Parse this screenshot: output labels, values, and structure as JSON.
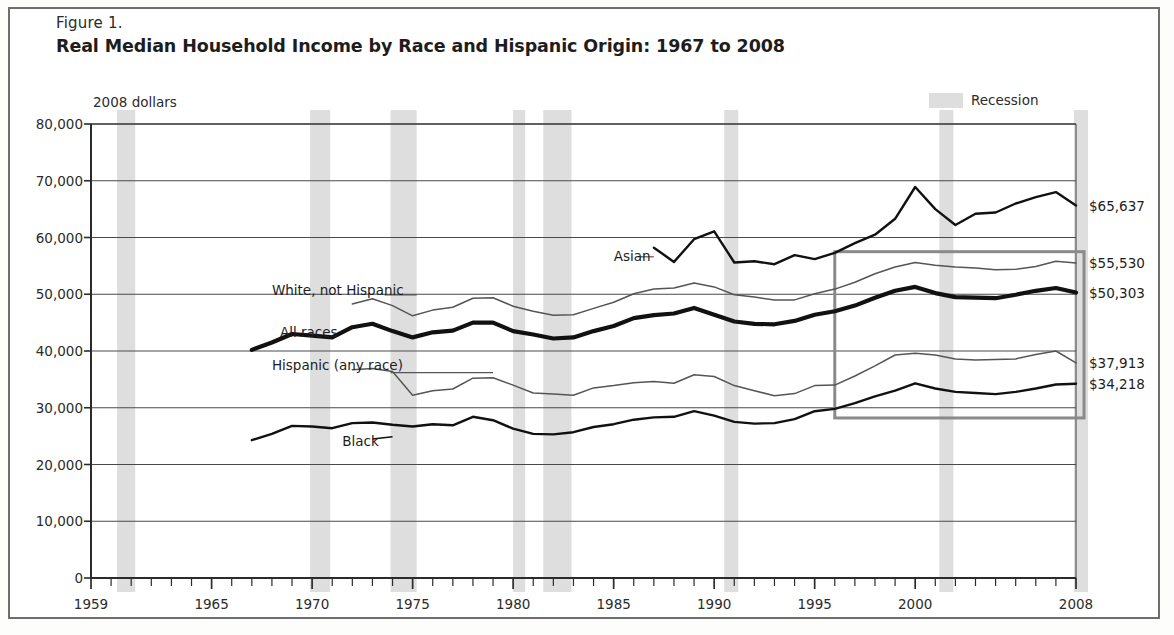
{
  "figure": {
    "label": "Figure 1.",
    "title": "Real Median Household Income by Race and Hispanic Origin: 1967 to 2008",
    "units_note": "2008 dollars"
  },
  "legend": {
    "recession_label": "Recession",
    "recession_color": "#dedede"
  },
  "colors": {
    "axis": "#2b2b2b",
    "grid": "#4a4a4a",
    "bold_line": "#111111",
    "thin_line": "#555555",
    "recession_band": "#dedede",
    "highlight_box_border": "#8a8a8a",
    "frame": "#6e6e6e"
  },
  "chart_data": {
    "type": "line",
    "title": "Real Median Household Income by Race and Hispanic Origin: 1967 to 2008",
    "subtitle": "2008 dollars",
    "xlabel": "",
    "ylabel": "2008 dollars",
    "xlim": [
      1959,
      2008
    ],
    "ylim": [
      0,
      80000
    ],
    "ytick_values": [
      0,
      10000,
      20000,
      30000,
      40000,
      50000,
      60000,
      70000,
      80000
    ],
    "ytick_labels": [
      "0",
      "10,000",
      "20,000",
      "30,000",
      "40,000",
      "50,000",
      "60,000",
      "70,000",
      "80,000"
    ],
    "xtick_values": [
      1959,
      1965,
      1970,
      1975,
      1980,
      1985,
      1990,
      1995,
      2000,
      2008
    ],
    "xtick_labels": [
      "1959",
      "1965",
      "1970",
      "1975",
      "1980",
      "1985",
      "1990",
      "1995",
      "2000",
      "2008"
    ],
    "xtick_minor_step": 1,
    "grid": "horizontal",
    "legend_position": "top-right",
    "recessions": [
      {
        "start": 1960.3,
        "end": 1961.2
      },
      {
        "start": 1969.9,
        "end": 1970.9
      },
      {
        "start": 1973.9,
        "end": 1975.2
      },
      {
        "start": 1980.0,
        "end": 1980.6
      },
      {
        "start": 1981.5,
        "end": 1982.9
      },
      {
        "start": 1990.5,
        "end": 1991.2
      },
      {
        "start": 2001.2,
        "end": 2001.9
      },
      {
        "start": 2007.9,
        "end": 2008.6
      }
    ],
    "highlight_box": {
      "x_start": 1996,
      "x_end": 2008.4,
      "y_bottom": 28200,
      "y_top": 57500
    },
    "annotations": [
      {
        "text": "Asian",
        "x": 1985.0,
        "y": 56600,
        "anchor": "right-of-start"
      },
      {
        "text": "White, not Hispanic",
        "x": 1968.0,
        "y": 50600
      },
      {
        "text": "All races",
        "x": 1968.4,
        "y": 43100
      },
      {
        "text": "Hispanic (any race)",
        "x": 1968.0,
        "y": 37300
      },
      {
        "text": "Black",
        "x": 1971.5,
        "y": 23900
      }
    ],
    "end_labels": [
      {
        "text": "$65,637",
        "series": "Asian",
        "value": 65637
      },
      {
        "text": "$55,530",
        "series": "White, not Hispanic",
        "value": 55530
      },
      {
        "text": "$50,303",
        "series": "All races",
        "value": 50303
      },
      {
        "text": "$37,913",
        "series": "Hispanic (any race)",
        "value": 37913
      },
      {
        "text": "$34,218",
        "series": "Black",
        "value": 34218
      }
    ],
    "series": [
      {
        "name": "Asian",
        "style": "medium",
        "x": [
          1987,
          1988,
          1989,
          1990,
          1991,
          1992,
          1993,
          1994,
          1995,
          1996,
          1997,
          1998,
          1999,
          2000,
          2001,
          2002,
          2003,
          2004,
          2005,
          2006,
          2007,
          2008
        ],
        "values": [
          58200,
          55700,
          59700,
          61100,
          55600,
          55800,
          55300,
          56900,
          56200,
          57300,
          59000,
          60500,
          63300,
          68900,
          65000,
          62200,
          64200,
          64400,
          66000,
          67100,
          68000,
          65637
        ]
      },
      {
        "name": "White, not Hispanic",
        "style": "thin",
        "x": [
          1972,
          1973,
          1974,
          1975,
          1976,
          1977,
          1978,
          1979,
          1980,
          1981,
          1982,
          1983,
          1984,
          1985,
          1986,
          1987,
          1988,
          1989,
          1990,
          1991,
          1992,
          1993,
          1994,
          1995,
          1996,
          1997,
          1998,
          1999,
          2000,
          2001,
          2002,
          2003,
          2004,
          2005,
          2006,
          2007,
          2008
        ],
        "values": [
          48300,
          49200,
          48000,
          46200,
          47200,
          47700,
          49300,
          49400,
          47900,
          47000,
          46300,
          46400,
          47500,
          48600,
          50100,
          50900,
          51100,
          52000,
          51300,
          49900,
          49500,
          49000,
          49000,
          50100,
          50900,
          52100,
          53600,
          54800,
          55600,
          55100,
          54800,
          54600,
          54300,
          54400,
          54900,
          55800,
          55530
        ]
      },
      {
        "name": "All races",
        "style": "bold",
        "x": [
          1967,
          1968,
          1969,
          1970,
          1971,
          1972,
          1973,
          1974,
          1975,
          1976,
          1977,
          1978,
          1979,
          1980,
          1981,
          1982,
          1983,
          1984,
          1985,
          1986,
          1987,
          1988,
          1989,
          1990,
          1991,
          1992,
          1993,
          1994,
          1995,
          1996,
          1997,
          1998,
          1999,
          2000,
          2001,
          2002,
          2003,
          2004,
          2005,
          2006,
          2007,
          2008
        ],
        "values": [
          40200,
          41500,
          43000,
          42700,
          42400,
          44200,
          44800,
          43500,
          42400,
          43300,
          43600,
          45000,
          45000,
          43500,
          42900,
          42200,
          42400,
          43500,
          44400,
          45800,
          46300,
          46600,
          47600,
          46400,
          45200,
          44800,
          44700,
          45300,
          46400,
          47000,
          48000,
          49400,
          50600,
          51300,
          50200,
          49500,
          49400,
          49300,
          49900,
          50600,
          51100,
          50303
        ]
      },
      {
        "name": "Hispanic (any race)",
        "style": "thin",
        "x": [
          1972,
          1973,
          1974,
          1975,
          1976,
          1977,
          1978,
          1979,
          1980,
          1981,
          1982,
          1983,
          1984,
          1985,
          1986,
          1987,
          1988,
          1989,
          1990,
          1991,
          1992,
          1993,
          1994,
          1995,
          1996,
          1997,
          1998,
          1999,
          2000,
          2001,
          2002,
          2003,
          2004,
          2005,
          2006,
          2007,
          2008
        ],
        "values": [
          36700,
          36900,
          36400,
          32200,
          33000,
          33300,
          35200,
          35300,
          34000,
          32600,
          32400,
          32200,
          33500,
          33900,
          34400,
          34600,
          34300,
          35800,
          35500,
          33900,
          33000,
          32100,
          32500,
          33900,
          34000,
          35600,
          37400,
          39300,
          39600,
          39300,
          38600,
          38400,
          38500,
          38600,
          39400,
          40000,
          37913
        ]
      },
      {
        "name": "Black",
        "style": "medium",
        "x": [
          1967,
          1968,
          1969,
          1970,
          1971,
          1972,
          1973,
          1974,
          1975,
          1976,
          1977,
          1978,
          1979,
          1980,
          1981,
          1982,
          1983,
          1984,
          1985,
          1986,
          1987,
          1988,
          1989,
          1990,
          1991,
          1992,
          1993,
          1994,
          1995,
          1996,
          1997,
          1998,
          1999,
          2000,
          2001,
          2002,
          2003,
          2004,
          2005,
          2006,
          2007,
          2008
        ],
        "values": [
          24300,
          25400,
          26800,
          26700,
          26400,
          27300,
          27400,
          27000,
          26700,
          27100,
          26900,
          28400,
          27800,
          26300,
          25400,
          25300,
          25700,
          26600,
          27100,
          27900,
          28300,
          28400,
          29400,
          28600,
          27500,
          27200,
          27300,
          28000,
          29400,
          29800,
          30800,
          32000,
          33000,
          34300,
          33400,
          32800,
          32600,
          32400,
          32800,
          33400,
          34100,
          34218
        ]
      }
    ]
  }
}
